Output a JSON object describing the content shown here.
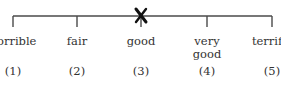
{
  "scale": {
    "points": [
      {
        "label": "horrible",
        "number": "(1)",
        "x": 13
      },
      {
        "label": "fair",
        "number": "(2)",
        "x": 77
      },
      {
        "label": "good",
        "number": "(3)",
        "x": 141
      },
      {
        "label": "very\ngood",
        "number": "(4)",
        "x": 207
      },
      {
        "label": "terrific",
        "number": "(5)",
        "x": 272
      }
    ],
    "selected_index": 2,
    "selected_mark": "X",
    "line_color": "#4a4a4a",
    "mark_color": "#111111"
  }
}
